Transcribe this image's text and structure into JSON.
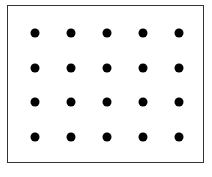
{
  "diagram": {
    "type": "dot-grid",
    "rows": 4,
    "columns": 5,
    "dot_count": 20,
    "dot_color": "#000000",
    "border_color": "#333333",
    "background": "#ffffff",
    "x_centers": [
      35,
      71,
      107,
      143,
      179
    ],
    "y_centers": [
      33,
      68,
      102,
      137
    ]
  }
}
